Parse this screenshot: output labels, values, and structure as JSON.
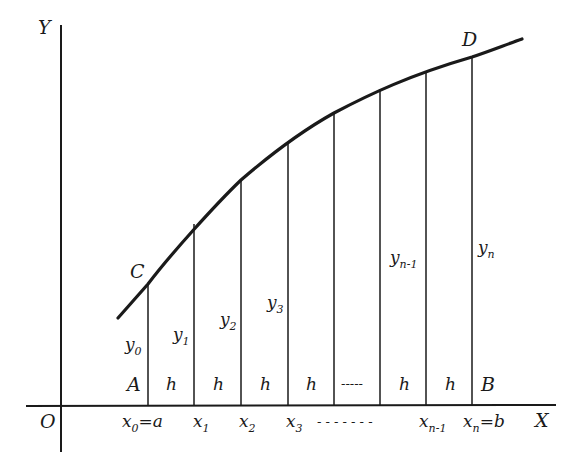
{
  "diagram": {
    "colors": {
      "ink": "#1a1a1a",
      "background": "#ffffff"
    },
    "axes": {
      "x_label": "X",
      "y_label": "Y",
      "origin_label": "O"
    },
    "points": {
      "C": "C",
      "D": "D",
      "A": "A",
      "B": "B"
    },
    "ordinates": [
      {
        "base": "y",
        "sub": "0"
      },
      {
        "base": "y",
        "sub": "1"
      },
      {
        "base": "y",
        "sub": "2"
      },
      {
        "base": "y",
        "sub": "3"
      },
      {
        "base": "y",
        "sub": "n-1"
      },
      {
        "base": "y",
        "sub": "n"
      }
    ],
    "interval_label": "h",
    "interval_ellipsis": "-----",
    "abscissas": [
      {
        "base": "x",
        "sub": "0",
        "suffix": "=a"
      },
      {
        "base": "x",
        "sub": "1",
        "suffix": ""
      },
      {
        "base": "x",
        "sub": "2",
        "suffix": ""
      },
      {
        "base": "x",
        "sub": "3",
        "suffix": ""
      },
      {
        "base": "x",
        "sub": "n-1",
        "suffix": ""
      },
      {
        "base": "x",
        "sub": "n",
        "suffix": "=b"
      }
    ],
    "abscissa_ellipsis": "- - - - - - -"
  }
}
